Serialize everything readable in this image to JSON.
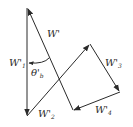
{
  "diagram": {
    "type": "vector-polygon",
    "stroke_color": "#2a2a2a",
    "background": "#ffffff",
    "labels": {
      "w_prime": {
        "main": "W'",
        "sub": ""
      },
      "w1": {
        "main": "W'",
        "sub": "1"
      },
      "w2": {
        "main": "W'",
        "sub": "2"
      },
      "w3": {
        "main": "W'",
        "sub": "3"
      },
      "w4": {
        "main": "W'",
        "sub": "4"
      },
      "theta": {
        "main": "θ'",
        "sub": "b"
      }
    },
    "vectors": [
      {
        "name": "W'1",
        "from": [
          27,
          8
        ],
        "to": [
          27,
          116
        ]
      },
      {
        "name": "W'2",
        "from": [
          27,
          116
        ],
        "to": [
          90,
          44
        ]
      },
      {
        "name": "W'3",
        "from": [
          90,
          44
        ],
        "to": [
          120,
          92
        ]
      },
      {
        "name": "W'4",
        "from": [
          120,
          92
        ],
        "to": [
          73,
          110
        ]
      },
      {
        "name": "W'",
        "from": [
          73,
          110
        ],
        "to": [
          27,
          8
        ]
      }
    ]
  }
}
